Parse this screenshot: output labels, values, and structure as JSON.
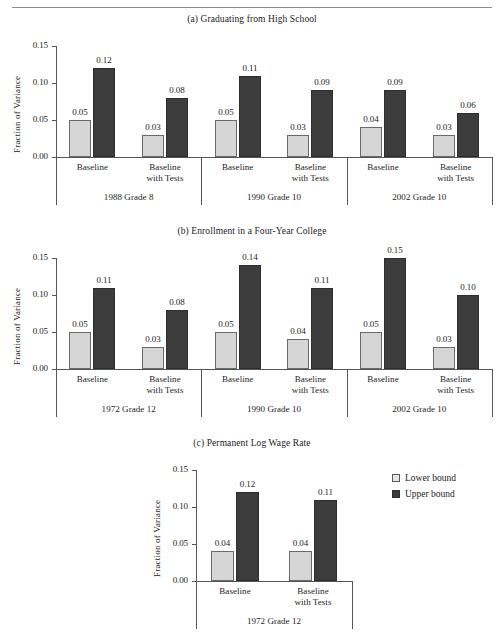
{
  "figure": {
    "ylabel": "Fraction of Variance",
    "yticks": [
      "0.15",
      "0.10",
      "0.05",
      "0.00"
    ],
    "ylim": [
      0,
      0.15
    ],
    "legend": {
      "items": [
        {
          "label": "Lower bound",
          "series": "lower",
          "color": "#e6e6e6"
        },
        {
          "label": "Upper bound",
          "series": "upper",
          "color": "#3c3c3c"
        }
      ]
    },
    "colors": {
      "lower_bound": "#d6d6d6",
      "upper_bound": "#3c3c3c",
      "axis": "#555555",
      "text": "#1d1d1d"
    }
  },
  "panels": [
    {
      "id": "a",
      "title": "(a) Graduating from High School",
      "groups": [
        {
          "label": "1988 Grade 8",
          "categories": [
            "Baseline",
            "Baseline with Tests"
          ],
          "lower": [
            0.05,
            0.03
          ],
          "upper": [
            0.12,
            0.08
          ],
          "lower_labels": [
            "0.05",
            "0.03"
          ],
          "upper_labels": [
            "0.12",
            "0.08"
          ]
        },
        {
          "label": "1990 Grade 10",
          "categories": [
            "Baseline",
            "Baseline with Tests"
          ],
          "lower": [
            0.05,
            0.03
          ],
          "upper": [
            0.11,
            0.09
          ],
          "lower_labels": [
            "0.05",
            "0.03"
          ],
          "upper_labels": [
            "0.11",
            "0.09"
          ]
        },
        {
          "label": "2002 Grade 10",
          "categories": [
            "Baseline",
            "Baseline with Tests"
          ],
          "lower": [
            0.04,
            0.03
          ],
          "upper": [
            0.09,
            0.06
          ],
          "lower_labels": [
            "0.04",
            "0.03"
          ],
          "upper_labels": [
            "0.09",
            "0.06"
          ]
        }
      ]
    },
    {
      "id": "b",
      "title": "(b) Enrollment in a Four-Year College",
      "groups": [
        {
          "label": "1972 Grade 12",
          "categories": [
            "Baseline",
            "Baseline with Tests"
          ],
          "lower": [
            0.05,
            0.03
          ],
          "upper": [
            0.11,
            0.08
          ],
          "lower_labels": [
            "0.05",
            "0.03"
          ],
          "upper_labels": [
            "0.11",
            "0.08"
          ]
        },
        {
          "label": "1990 Grade 10",
          "categories": [
            "Baseline",
            "Baseline with Tests"
          ],
          "lower": [
            0.05,
            0.04
          ],
          "upper": [
            0.14,
            0.11
          ],
          "lower_labels": [
            "0.05",
            "0.04"
          ],
          "upper_labels": [
            "0.14",
            "0.11"
          ]
        },
        {
          "label": "2002 Grade 10",
          "categories": [
            "Baseline",
            "Baseline with Tests"
          ],
          "lower": [
            0.05,
            0.03
          ],
          "upper": [
            0.15,
            0.1
          ],
          "lower_labels": [
            "0.05",
            "0.03"
          ],
          "upper_labels": [
            "0.15",
            "0.10"
          ]
        }
      ]
    },
    {
      "id": "c",
      "title": "(c) Permanent Log Wage Rate",
      "groups": [
        {
          "label": "1972 Grade 12",
          "categories": [
            "Baseline",
            "Baseline with Tests"
          ],
          "lower": [
            0.04,
            0.04
          ],
          "upper": [
            0.12,
            0.11
          ],
          "lower_labels": [
            "0.04",
            "0.04"
          ],
          "upper_labels": [
            "0.12",
            "0.11"
          ]
        }
      ]
    }
  ],
  "chart_data": {
    "type": "bar",
    "xlabel": "",
    "ylabel": "Fraction of Variance",
    "ylim": [
      0,
      0.15
    ],
    "yticks": [
      0.0,
      0.05,
      0.1,
      0.15
    ],
    "grid": false,
    "legend_position": "right",
    "series": [
      {
        "name": "Lower bound",
        "color": "#d6d6d6"
      },
      {
        "name": "Upper bound",
        "color": "#3c3c3c"
      }
    ],
    "panels": [
      {
        "panel": "a",
        "title": "(a) Graduating from High School",
        "categories": [
          "1988 Grade 8 / Baseline",
          "1988 Grade 8 / Baseline with Tests",
          "1990 Grade 10 / Baseline",
          "1990 Grade 10 / Baseline with Tests",
          "2002 Grade 10 / Baseline",
          "2002 Grade 10 / Baseline with Tests"
        ],
        "Lower bound": [
          0.05,
          0.03,
          0.05,
          0.03,
          0.04,
          0.03
        ],
        "Upper bound": [
          0.12,
          0.08,
          0.11,
          0.09,
          0.09,
          0.06
        ]
      },
      {
        "panel": "b",
        "title": "(b) Enrollment in a Four-Year College",
        "categories": [
          "1972 Grade 12 / Baseline",
          "1972 Grade 12 / Baseline with Tests",
          "1990 Grade 10 / Baseline",
          "1990 Grade 10 / Baseline with Tests",
          "2002 Grade 10 / Baseline",
          "2002 Grade 10 / Baseline with Tests"
        ],
        "Lower bound": [
          0.05,
          0.03,
          0.05,
          0.04,
          0.05,
          0.03
        ],
        "Upper bound": [
          0.11,
          0.08,
          0.14,
          0.11,
          0.15,
          0.1
        ]
      },
      {
        "panel": "c",
        "title": "(c) Permanent Log Wage Rate",
        "categories": [
          "1972 Grade 12 / Baseline",
          "1972 Grade 12 / Baseline with Tests"
        ],
        "Lower bound": [
          0.04,
          0.04
        ],
        "Upper bound": [
          0.12,
          0.11
        ]
      }
    ]
  }
}
